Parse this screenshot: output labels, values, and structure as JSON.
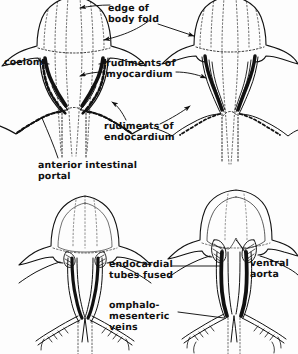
{
  "figure": {
    "type": "anatomical-line-diagram",
    "background_color": "#fdfdfd",
    "ink_color": "#111111",
    "panel_count": 4,
    "panels": [
      {
        "id": "panel-upper-left",
        "stage": "A",
        "position": "upper-left",
        "description": "Paired endocardial tubes with wide anterior intestinal portal, rudiments of myocardium shown as heavy black bands"
      },
      {
        "id": "panel-upper-right",
        "stage": "B",
        "position": "upper-right",
        "description": "Endocardial tubes approaching midline, body folds closing"
      },
      {
        "id": "panel-lower-left",
        "stage": "C",
        "position": "lower-left",
        "description": "Endocardial tubes nearly fused, omphalomesenteric veins converging"
      },
      {
        "id": "panel-lower-right",
        "stage": "D",
        "position": "lower-right",
        "description": "Endocardial tubes fused into single ventral aorta"
      }
    ]
  },
  "labels": [
    {
      "id": "edge-of-body-fold",
      "lines": [
        "edge of",
        "body fold"
      ],
      "x": 108,
      "y": 3,
      "align": "left"
    },
    {
      "id": "rudiments-myocardium",
      "lines": [
        "rudiments of",
        "myocardium"
      ],
      "x": 106,
      "y": 58,
      "align": "left"
    },
    {
      "id": "rudiments-endocardium",
      "lines": [
        "rudiments of",
        "endocardium"
      ],
      "x": 104,
      "y": 121,
      "align": "left"
    },
    {
      "id": "coelom",
      "lines": [
        "coelom"
      ],
      "x": 4,
      "y": 57,
      "align": "left"
    },
    {
      "id": "anterior-intestinal-portal",
      "lines": [
        "anterior intestinal",
        "portal"
      ],
      "x": 38,
      "y": 160,
      "align": "left"
    },
    {
      "id": "endocardial-tubes-fused",
      "lines": [
        "endocardial",
        "tubes fused"
      ],
      "x": 109,
      "y": 259,
      "align": "left"
    },
    {
      "id": "omphalomesenteric-veins",
      "lines": [
        "omphalo-",
        "mesenteric",
        "veins"
      ],
      "x": 109,
      "y": 300,
      "align": "left"
    },
    {
      "id": "ventral-aorta",
      "lines": [
        "ventral",
        "aorta"
      ],
      "x": 250,
      "y": 258,
      "align": "left"
    }
  ],
  "leaders": [
    {
      "id": "leader-edge-of-body-fold-top",
      "from": "edge-of-body-fold",
      "to": "panel-upper-left-body-fold-top"
    },
    {
      "id": "leader-edge-of-body-fold-side",
      "from": "edge-of-body-fold",
      "to": "panel-upper-left-body-fold-side"
    },
    {
      "id": "leader-edge-of-body-fold-right",
      "from": "edge-of-body-fold",
      "to": "panel-upper-right-body-fold"
    },
    {
      "id": "leader-myocardium-left",
      "from": "rudiments-myocardium",
      "to": "panel-upper-left-myocardium"
    },
    {
      "id": "leader-myocardium-right",
      "from": "rudiments-myocardium",
      "to": "panel-upper-right-myocardium"
    },
    {
      "id": "leader-endocardium-left",
      "from": "rudiments-endocardium",
      "to": "panel-upper-left-endocardium"
    },
    {
      "id": "leader-endocardium-right",
      "from": "rudiments-endocardium",
      "to": "panel-upper-right-endocardium"
    },
    {
      "id": "leader-anterior-portal",
      "from": "anterior-intestinal-portal",
      "to": "panel-upper-left-portal"
    },
    {
      "id": "leader-tubes-fused",
      "from": "endocardial-tubes-fused",
      "to": "panel-lower-right-fused-tube"
    },
    {
      "id": "leader-omphalomesenteric",
      "from": "omphalomesenteric-veins",
      "to": "panel-lower-right-veins"
    },
    {
      "id": "leader-ventral-aorta",
      "from": "ventral-aorta",
      "to": "panel-lower-right-aorta"
    }
  ]
}
